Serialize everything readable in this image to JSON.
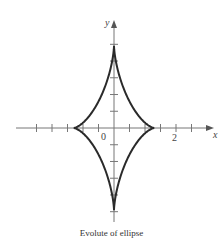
{
  "chart_data": {
    "type": "line",
    "title": "",
    "caption": "Evolute of ellipse",
    "xlabel": "x",
    "ylabel": "y",
    "curve": "astroid-like evolute: |x/1.3|^(2/3) + |y/2.65|^(2/3) = 1",
    "x_cusps": [
      -1.3,
      1.3
    ],
    "y_cusps": [
      -2.65,
      2.65
    ],
    "xlim": [
      -3.1,
      3.2
    ],
    "ylim": [
      -3.1,
      3.4
    ],
    "tick_step": 0.5,
    "x_tick_labels": [
      {
        "value": 0,
        "label": "0"
      },
      {
        "value": 2,
        "label": "2"
      }
    ],
    "grid": false,
    "legend": null
  },
  "labels": {
    "origin": "0",
    "x_two": "2",
    "x_axis": "x",
    "y_axis": "y",
    "caption": "Evolute of ellipse"
  },
  "colors": {
    "axis": "#666666",
    "curve": "#2a2a2a"
  }
}
